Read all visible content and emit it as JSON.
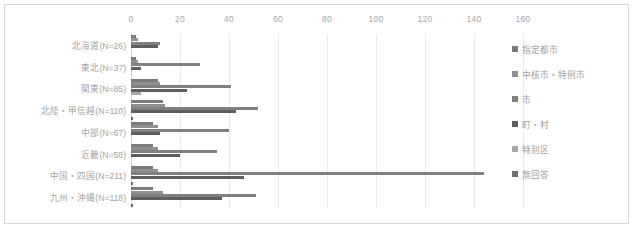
{
  "chart_data": {
    "type": "bar",
    "orientation": "horizontal",
    "title": "",
    "xlabel": "",
    "ylabel": "",
    "xlim": [
      0,
      160
    ],
    "xticks": [
      0,
      20,
      40,
      60,
      80,
      100,
      120,
      140,
      160
    ],
    "grid": true,
    "legend_position": "right",
    "categories": [
      "北海道(N=26)",
      "東北(N=37)",
      "関東(N=85)",
      "北陸・甲信越(N=110)",
      "中部(N=67)",
      "近畿(N=58)",
      "中国・四国(N=211)",
      "九州・沖縄(N=118)"
    ],
    "series": [
      {
        "name": "指定都市",
        "color": "#7b7b7b",
        "values": [
          2,
          2,
          11,
          13,
          9,
          9,
          9,
          9
        ]
      },
      {
        "name": "中核市・特例市",
        "color": "#8f8f8f",
        "values": [
          3,
          3,
          12,
          14,
          11,
          11,
          11,
          13
        ]
      },
      {
        "name": "市",
        "color": "#808080",
        "values": [
          12,
          28,
          41,
          52,
          40,
          35,
          144,
          51
        ]
      },
      {
        "name": "町・村",
        "color": "#5e5e5e",
        "values": [
          11,
          4,
          23,
          43,
          12,
          20,
          46,
          37
        ]
      },
      {
        "name": "特別区",
        "color": "#a8a8a8",
        "values": [
          0,
          0,
          4,
          0,
          0,
          0,
          0,
          0
        ]
      },
      {
        "name": "無回答",
        "color": "#6e6e6e",
        "values": [
          0,
          0,
          0,
          1,
          0,
          0,
          1,
          1
        ]
      }
    ]
  },
  "legend": {
    "items": [
      {
        "label": "指定都市",
        "color": "#7b7b7b"
      },
      {
        "label": "中核市・特例市",
        "color": "#8f8f8f"
      },
      {
        "label": "市",
        "color": "#808080"
      },
      {
        "label": "町・村",
        "color": "#5e5e5e"
      },
      {
        "label": "特別区",
        "color": "#a8a8a8"
      },
      {
        "label": "無回答",
        "color": "#6e6e6e"
      }
    ]
  }
}
